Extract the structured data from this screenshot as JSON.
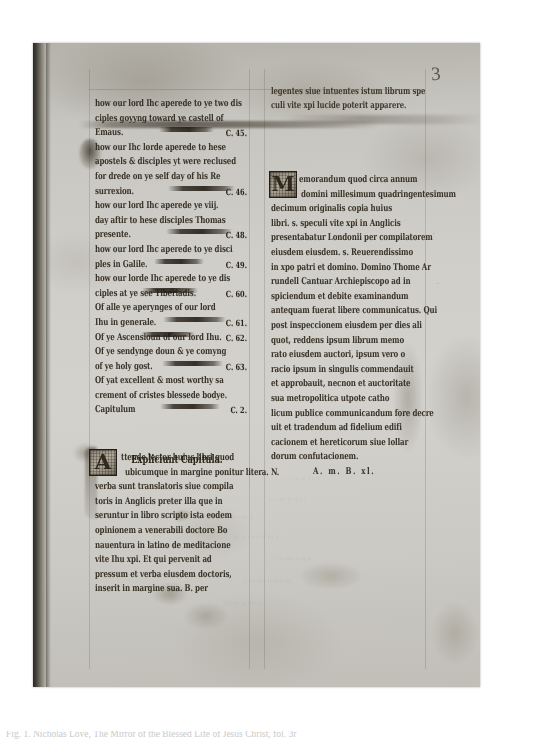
{
  "document": {
    "kind": "medieval-manuscript-leaf-photograph",
    "folio_number": "3"
  },
  "left_column": {
    "language": "Middle English",
    "entries": [
      {
        "text": "how our lord Ihc aperede to ye two dis",
        "ref": ""
      },
      {
        "text": "ciples goyyng toward ye castell of",
        "ref": ""
      },
      {
        "text": "Emaus.",
        "ref": "C. 45."
      },
      {
        "text": "how our Ihc lorde aperede to hese",
        "ref": ""
      },
      {
        "text": "apostels & disciples yt were reclused",
        "ref": ""
      },
      {
        "text": "for drede on ye self day of his Re",
        "ref": ""
      },
      {
        "text": "surrexion.",
        "ref": "C. 46."
      },
      {
        "text": "how our lord Ihc aperede ye viij.",
        "ref": ""
      },
      {
        "text": "day aftir to hese disciples Thomas",
        "ref": ""
      },
      {
        "text": "presente.",
        "ref": "C. 48."
      },
      {
        "text": "how our lord Ihc aperede to ye disci",
        "ref": ""
      },
      {
        "text": "ples in Galile.",
        "ref": "C. 49."
      },
      {
        "text": "how our lorde Ihc aperede to ye dis",
        "ref": ""
      },
      {
        "text": "ciples at ye see Tiberiadis.",
        "ref": "C. 60."
      },
      {
        "text": "Of alle ye aperynges of our lord",
        "ref": ""
      },
      {
        "text": "Ihu in generale.",
        "ref": "C. 61."
      },
      {
        "text": "Of ye Ascensioun of our lord Ihu.",
        "ref": "C. 62."
      },
      {
        "text": "Of ye sendynge doun & ye comyng",
        "ref": ""
      },
      {
        "text": "of ye holy gost.",
        "ref": "C. 63."
      },
      {
        "text": "Of yat excellent & most worthy sa",
        "ref": ""
      },
      {
        "text": "crement of cristes blessede bodye.",
        "ref": ""
      },
      {
        "text": "Capitulum",
        "ref": "C. 2."
      }
    ],
    "rubric": "Expliciunt Capitula.",
    "latin_note": {
      "initial": "A",
      "lines": [
        "ttende lector huius libri quod",
        "ubicumque in margine ponitur litera. N.",
        "verba sunt translatoris siue compila",
        "toris in Anglicis preter illa que in",
        "seruntur in libro scripto ista eodem",
        "opinionem a venerabili doctore Bo",
        "nauentura in latino de meditacione",
        "vite Ihu xpi. Et qui pervenit ad",
        "pressum et verba eiusdem doctoris,",
        "inserit in margine sua. B. per"
      ],
      "first_line_indent": "ttende lector huius libri quod"
    }
  },
  "right_column": {
    "language": "Latin",
    "lines_before_initial": [
      "legentes siue intuentes istum librum spe",
      "culi vite xpi lucide poterit apparere."
    ],
    "memorandum": {
      "initial": "M",
      "lines": [
        "emorandum quod circa annum",
        "domini millesimum quadringentesimum",
        "decimum originalis copia huius",
        "libri. s. speculi vite xpi in Anglicis",
        "presentabatur Londonii per compilatorem",
        "eiusdem eiusdem. s. Reuerendissimo",
        "in xpo patri et domino. Domino Thome Ar",
        "rundell Cantuar Archiepiscopo ad in",
        "spiciendum et debite examinandum",
        "antequam fuerat libere communicatus. Qui",
        "post inspeccionem eiusdem per dies ali",
        "quot, reddens ipsum librum memo",
        "rato eiusdem auctori, ipsum vero o",
        "racio ipsum in singulis commendauit",
        "et approbauit, necnon et auctoritate",
        "sua metropolitica utpote catho",
        "licum publice communicandum fore decre",
        "uit et tradendum ad fidelium edifi",
        "cacionem et hereticorum siue lollar",
        "dorum confutacionem.",
        "A. m. B. xl."
      ]
    }
  },
  "margin_notes": [
    "",
    ""
  ],
  "caption": {
    "text": "Fig. 1.  Nicholas Love, The Mirror of the Blessed Life of Jesus Christ, fol. 3r"
  },
  "colors": {
    "parchment": "#cfcec9",
    "ink": "#2b2418",
    "gutter_shadow": "#23211d",
    "plate_background": "#ffffff"
  }
}
